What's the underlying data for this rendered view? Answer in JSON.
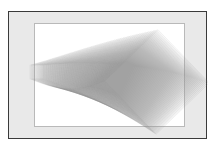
{
  "artwork": {
    "title": "Rotating Square Fan",
    "medium": "generative-vector-composition",
    "frame": {
      "outer_border_color": "#3a3a3a",
      "mat_color": "#e9e9e9",
      "inner_border_color": "#b9b9b9",
      "canvas_color": "#ffffff",
      "page_background": "#ffffff"
    },
    "caption": ""
  },
  "chart_data": {
    "type": "scatter",
    "title": "Rotating Square Fan",
    "subtitle": "",
    "xlabel": "",
    "ylabel": "",
    "xlim": [
      0,
      199
    ],
    "ylim": [
      0,
      128
    ],
    "grid": false,
    "legend_position": "none",
    "annotations": [],
    "tick_labels_x": [],
    "tick_labels_y": [],
    "series": [
      {
        "name": "square-sweep",
        "description": "Sequence of semi-transparent squares that grow in size and rotate progressively from a near-degenerate sliver at the left toward large diamonds at the right.",
        "stroke_color": "#8a8a8a",
        "fill_color": "#9a9a9a",
        "stroke_opacity": 0.16,
        "fill_opacity": 0.045,
        "count": 96,
        "pivot_x": 18,
        "pivot_y": 66,
        "size_start": 14,
        "size_end": 74,
        "angle_start": 0,
        "angle_end": 46,
        "center_drift_x_start": 28,
        "center_drift_x_end": 148,
        "center_drift_y_start": 60,
        "center_drift_y_end": 70
      }
    ]
  }
}
